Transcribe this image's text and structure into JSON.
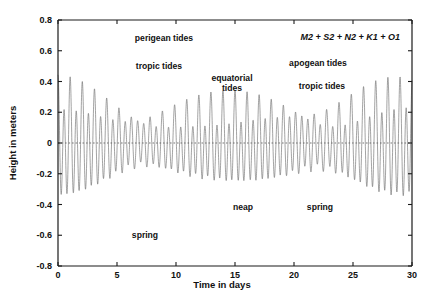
{
  "chart_data": {
    "type": "line",
    "title": "",
    "xlabel": "Time in days",
    "ylabel": "Height in meters",
    "xlim": [
      0,
      30
    ],
    "ylim": [
      -0.8,
      0.8
    ],
    "xticks": [
      "0",
      "5",
      "10",
      "15",
      "20",
      "25",
      "30"
    ],
    "xtick_values": [
      0,
      5,
      10,
      15,
      20,
      25,
      30
    ],
    "yticks": [
      "0.8",
      "0.6",
      "0.4",
      "0.2",
      "0",
      "-0.2",
      "-0.4",
      "-0.6",
      "-0.8"
    ],
    "ytick_values": [
      0.8,
      0.6,
      0.4,
      0.2,
      0,
      -0.2,
      -0.4,
      -0.6,
      -0.8
    ],
    "grid": false,
    "legend": null,
    "series": [
      {
        "name": "predicted tide",
        "color": "#6a6a6a",
        "description": "Sum of five harmonic constituents sampled every 0.01 day over 30 days",
        "constituents": [
          {
            "name": "M2",
            "amplitude": 0.21,
            "period_hours": 12.4206,
            "phase_deg": 0
          },
          {
            "name": "S2",
            "amplitude": 0.072,
            "period_hours": 12.0,
            "phase_deg": 0
          },
          {
            "name": "N2",
            "amplitude": 0.048,
            "period_hours": 12.6583,
            "phase_deg": 0
          },
          {
            "name": "K1",
            "amplitude": 0.065,
            "period_hours": 23.9345,
            "phase_deg": 0
          },
          {
            "name": "O1",
            "amplitude": 0.046,
            "period_hours": 25.8193,
            "phase_deg": 0
          }
        ]
      }
    ],
    "envelope_notes": {
      "spring_max_height_m": 0.6,
      "spring_min_height_m": -0.49,
      "neap_max_height_m": 0.3,
      "neap_min_height_m": -0.3,
      "spring_days": [
        7,
        21.5
      ],
      "neap_days": [
        14.5,
        29
      ]
    },
    "annotations": [
      {
        "id": "perigean",
        "text": "perigean tides",
        "x_day": 9.0,
        "y_m": 0.695
      },
      {
        "id": "tropic-left",
        "text": "tropic tides",
        "x_day": 8.6,
        "y_m": 0.515
      },
      {
        "id": "equatorial",
        "text": "equatorial\ntides",
        "x_day": 16.1,
        "y_m": 0.44
      },
      {
        "id": "apogean",
        "text": "apogean tides",
        "x_day": 23.4,
        "y_m": 0.555
      },
      {
        "id": "tropic-right",
        "text": "tropic tides",
        "x_day": 23.8,
        "y_m": 0.405
      },
      {
        "id": "neap",
        "text": "neap",
        "x_day": 15.7,
        "y_m": -0.405
      },
      {
        "id": "spring-left",
        "text": "spring",
        "x_day": 7.4,
        "y_m": -0.585
      },
      {
        "id": "spring-right",
        "text": "spring",
        "x_day": 22.2,
        "y_m": -0.405
      }
    ],
    "formula": "M2 + S2 + N2 + K1 + O1"
  },
  "axes": {
    "x_label": "Time in days",
    "y_label": "Height in meters",
    "x_tick_labels": [
      "0",
      "5",
      "10",
      "15",
      "20",
      "25",
      "30"
    ],
    "y_tick_labels": [
      "0.8",
      "0.6",
      "0.4",
      "0.2",
      "0",
      "-0.2",
      "-0.4",
      "-0.6",
      "-0.8"
    ]
  },
  "annotations": {
    "perigean_tides": "perigean tides",
    "tropic_tides_left": "tropic tides",
    "equatorial_tides_line1": "equatorial",
    "equatorial_tides_line2": "tides",
    "apogean_tides": "apogean tides",
    "tropic_tides_right": "tropic tides",
    "neap": "neap",
    "spring_left": "spring",
    "spring_right": "spring",
    "formula": "M2 + S2 + N2 + K1 + O1"
  },
  "colors": {
    "wave": "#6a6a6a",
    "axis": "#1a1a1a",
    "text": "#111111",
    "background": "#ffffff"
  }
}
